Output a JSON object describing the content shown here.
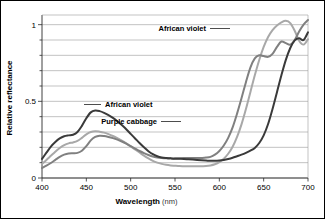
{
  "chart_data": {
    "type": "line",
    "title": "",
    "subtitle": "",
    "xlabel": "Wavelength",
    "xlabel_unit": "(nm)",
    "ylabel": "Relative reflectance",
    "xlim": [
      400,
      700
    ],
    "ylim": [
      0,
      1.05
    ],
    "xticks": [
      400,
      450,
      500,
      550,
      600,
      650,
      700
    ],
    "xtick_labels": [
      "400",
      "450",
      "500",
      "550",
      "600",
      "650",
      "700"
    ],
    "yticks": [
      0,
      0.1,
      0.2,
      0.3,
      0.4,
      0.5,
      0.6,
      0.7,
      0.8,
      0.9,
      1.0
    ],
    "ytick_labels_shown": [
      "0",
      "0.5",
      "1"
    ],
    "ytick_labels_shown_values": [
      0,
      0.5,
      1
    ],
    "grid": "horizontal",
    "grid_step": 0.1,
    "legend_position": "inline-annotations",
    "x": [
      400,
      405,
      410,
      415,
      420,
      425,
      430,
      435,
      440,
      445,
      450,
      455,
      460,
      465,
      470,
      475,
      480,
      485,
      490,
      495,
      500,
      505,
      510,
      515,
      520,
      525,
      530,
      535,
      540,
      545,
      550,
      555,
      560,
      565,
      570,
      575,
      580,
      585,
      590,
      595,
      600,
      605,
      610,
      615,
      620,
      625,
      630,
      635,
      640,
      645,
      650,
      655,
      660,
      665,
      670,
      675,
      680,
      685,
      690,
      695,
      700
    ],
    "series": [
      {
        "name": "African violet",
        "color": "#3a3a3a",
        "label_position": "middle",
        "values": [
          0.125,
          0.165,
          0.205,
          0.235,
          0.258,
          0.272,
          0.278,
          0.282,
          0.3,
          0.34,
          0.39,
          0.428,
          0.44,
          0.436,
          0.425,
          0.41,
          0.392,
          0.37,
          0.345,
          0.318,
          0.288,
          0.258,
          0.228,
          0.2,
          0.175,
          0.155,
          0.142,
          0.134,
          0.13,
          0.128,
          0.126,
          0.125,
          0.124,
          0.122,
          0.12,
          0.118,
          0.116,
          0.114,
          0.112,
          0.112,
          0.114,
          0.118,
          0.124,
          0.132,
          0.142,
          0.152,
          0.164,
          0.178,
          0.196,
          0.228,
          0.278,
          0.352,
          0.45,
          0.56,
          0.67,
          0.77,
          0.848,
          0.898,
          0.912,
          0.9,
          0.95
        ]
      },
      {
        "name": "Purple cabbage",
        "color": "#808080",
        "label_position": "lower-right",
        "values": [
          0.065,
          0.08,
          0.098,
          0.118,
          0.138,
          0.152,
          0.16,
          0.162,
          0.164,
          0.178,
          0.208,
          0.245,
          0.268,
          0.276,
          0.274,
          0.268,
          0.26,
          0.25,
          0.238,
          0.224,
          0.208,
          0.192,
          0.176,
          0.162,
          0.15,
          0.14,
          0.134,
          0.13,
          0.128,
          0.128,
          0.128,
          0.129,
          0.13,
          0.13,
          0.13,
          0.13,
          0.131,
          0.133,
          0.138,
          0.152,
          0.176,
          0.212,
          0.262,
          0.33,
          0.42,
          0.52,
          0.625,
          0.72,
          0.78,
          0.8,
          0.795,
          0.79,
          0.81,
          0.855,
          0.89,
          0.88,
          0.87,
          0.9,
          0.955,
          1.0,
          1.03
        ]
      },
      {
        "name": "African violet",
        "color": "#a8a8a8",
        "label_position": "top-right",
        "values": [
          0.092,
          0.118,
          0.145,
          0.172,
          0.196,
          0.214,
          0.226,
          0.232,
          0.242,
          0.262,
          0.285,
          0.3,
          0.305,
          0.302,
          0.296,
          0.286,
          0.274,
          0.26,
          0.244,
          0.226,
          0.206,
          0.186,
          0.166,
          0.146,
          0.128,
          0.112,
          0.1,
          0.092,
          0.086,
          0.082,
          0.08,
          0.078,
          0.077,
          0.076,
          0.076,
          0.076,
          0.077,
          0.078,
          0.082,
          0.09,
          0.104,
          0.126,
          0.158,
          0.204,
          0.268,
          0.35,
          0.45,
          0.56,
          0.67,
          0.77,
          0.855,
          0.92,
          0.965,
          0.995,
          1.015,
          1.025,
          1.01,
          0.96,
          0.895,
          0.87,
          0.905
        ]
      }
    ],
    "annotations": [
      {
        "text": "African violet",
        "target_series": "African violet",
        "leader": "right",
        "x_text": 206,
        "y_text": 31
      },
      {
        "text": "African violet",
        "target_series": "African violet",
        "leader": "left",
        "x_text": 105,
        "y_text": 107
      },
      {
        "text": "Purple cabbage",
        "target_series": "Purple cabbage",
        "leader": "right",
        "x_text": 157,
        "y_text": 124
      }
    ]
  },
  "axes": {
    "y_axis_label": "Relative reflectance",
    "x_axis_label_bold": "Wavelength",
    "x_axis_label_unit": "(nm)"
  },
  "colors": {
    "series_dark": "#3a3a3a",
    "series_medium": "#808080",
    "series_light": "#a8a8a8",
    "gridline": "#9a9a9a",
    "axis": "#2b2b2b",
    "background": "#ffffff",
    "border": "#000000"
  }
}
